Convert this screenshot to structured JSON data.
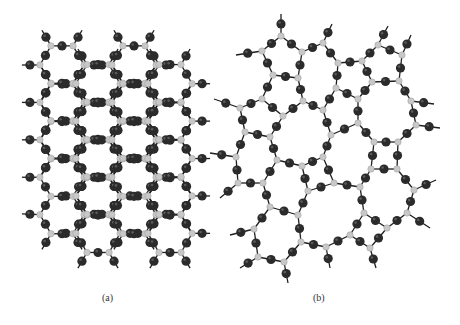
{
  "figure": {
    "panels": [
      {
        "id": "a",
        "label": "(a)",
        "description": "crystalline network"
      },
      {
        "id": "b",
        "label": "(b)",
        "description": "amorphous network"
      }
    ],
    "colors": {
      "background": "#ffffff",
      "bridging_atom": "#2b2b2b",
      "network_atom": "#c8c8c8",
      "bond": "#1e1e1e",
      "caption": "#333333"
    },
    "crystal": {
      "origin_x": 27,
      "origin_y": 42,
      "bond_len": 24,
      "rows": 6,
      "cols": 4
    },
    "amorphous_nodes": [
      [
        281,
        36
      ],
      [
        262,
        51
      ],
      [
        302,
        52
      ],
      [
        323,
        43
      ],
      [
        338,
        63
      ],
      [
        362,
        61
      ],
      [
        378,
        45
      ],
      [
        402,
        55
      ],
      [
        273,
        75
      ],
      [
        298,
        78
      ],
      [
        262,
        99
      ],
      [
        240,
        108
      ],
      [
        283,
        116
      ],
      [
        303,
        101
      ],
      [
        323,
        110
      ],
      [
        336,
        88
      ],
      [
        358,
        99
      ],
      [
        372,
        82
      ],
      [
        399,
        81
      ],
      [
        411,
        101
      ],
      [
        416,
        125
      ],
      [
        245,
        132
      ],
      [
        270,
        137
      ],
      [
        331,
        135
      ],
      [
        358,
        123
      ],
      [
        374,
        142
      ],
      [
        398,
        142
      ],
      [
        236,
        157
      ],
      [
        277,
        160
      ],
      [
        302,
        166
      ],
      [
        323,
        157
      ],
      [
        238,
        183
      ],
      [
        263,
        183
      ],
      [
        308,
        191
      ],
      [
        334,
        183
      ],
      [
        360,
        187
      ],
      [
        371,
        169
      ],
      [
        397,
        169
      ],
      [
        414,
        190
      ],
      [
        270,
        207
      ],
      [
        298,
        215
      ],
      [
        254,
        229
      ],
      [
        364,
        213
      ],
      [
        387,
        228
      ],
      [
        407,
        213
      ],
      [
        350,
        235
      ],
      [
        301,
        242
      ],
      [
        326,
        247
      ],
      [
        370,
        248
      ],
      [
        258,
        257
      ],
      [
        284,
        262
      ]
    ],
    "amorphous_max_bond": 30,
    "amorphous_dangling": [
      [
        281,
        36,
        281,
        14
      ],
      [
        262,
        51,
        236,
        55
      ],
      [
        323,
        43,
        332,
        24
      ],
      [
        378,
        45,
        388,
        26
      ],
      [
        402,
        55,
        411,
        35
      ],
      [
        240,
        108,
        214,
        99
      ],
      [
        416,
        125,
        440,
        128
      ],
      [
        236,
        157,
        210,
        153
      ],
      [
        238,
        183,
        220,
        198
      ],
      [
        414,
        190,
        436,
        180
      ],
      [
        407,
        213,
        430,
        228
      ],
      [
        254,
        229,
        230,
        235
      ],
      [
        258,
        257,
        240,
        268
      ],
      [
        284,
        262,
        288,
        283
      ],
      [
        326,
        247,
        330,
        268
      ],
      [
        370,
        248,
        376,
        268
      ],
      [
        411,
        101,
        434,
        104
      ]
    ]
  }
}
